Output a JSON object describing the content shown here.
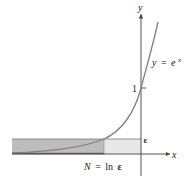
{
  "figure": {
    "function_label": "y = e^x",
    "function_label_parts": {
      "y": "y",
      "eq": "=",
      "base": "e",
      "exp": "x"
    },
    "y_axis_label": "y",
    "x_axis_label": "x",
    "tick_one": "1",
    "epsilon_label": "ε",
    "n_label_parts": {
      "n": "N",
      "eq": "=",
      "ln": "ln",
      "eps": "ε"
    },
    "n_label": "N = ln ε",
    "colors": {
      "curve": "#8a7a86",
      "axes": "#444444",
      "dark_shade": "#b9b9b9",
      "light_shade": "#e6e6e6",
      "text": "#222222"
    }
  }
}
